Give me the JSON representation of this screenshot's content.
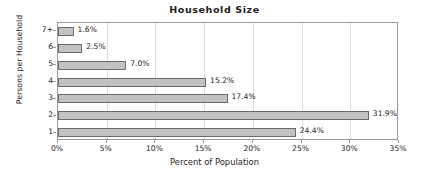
{
  "chart_data": {
    "type": "bar",
    "orientation": "horizontal",
    "title": "Household Size",
    "xlabel": "Percent of Population",
    "ylabel": "Persons per Household",
    "categories": [
      "1",
      "2",
      "3",
      "4",
      "5",
      "6",
      "7+"
    ],
    "values": [
      24.4,
      31.9,
      17.4,
      15.2,
      7.0,
      2.5,
      1.6
    ],
    "data_labels": [
      "24.4%",
      "31.9%",
      "17.4%",
      "15.2%",
      "7.0%",
      "2.5%",
      "1.6%"
    ],
    "xlim": [
      0,
      35
    ],
    "ylim": null,
    "xticks": [
      0,
      5,
      10,
      15,
      20,
      25,
      30,
      35
    ],
    "xtick_labels": [
      "0%",
      "5%",
      "10%",
      "15%",
      "20%",
      "25%",
      "30%",
      "35%"
    ],
    "ytick_labels_top_to_bottom": [
      "7+",
      "6",
      "5",
      "4",
      "3",
      "2",
      "1"
    ],
    "grid": "vertical",
    "legend": null,
    "colors": {
      "bar_fill": "#c2c2c2",
      "bar_border": "#6a6a6a",
      "axis": "#9a9a9a",
      "grid": "#dddddd",
      "text": "#232323",
      "background": "#ffffff"
    }
  }
}
